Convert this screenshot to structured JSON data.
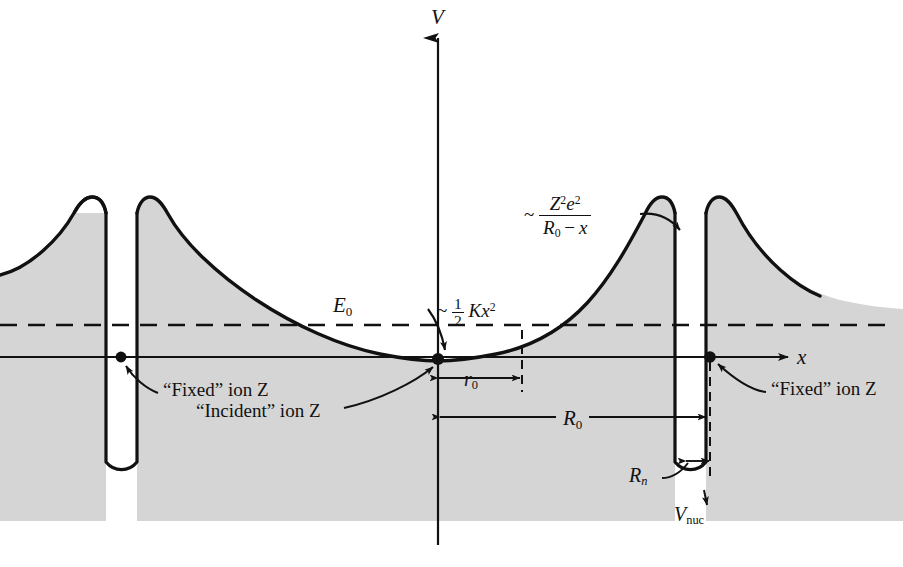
{
  "figure": {
    "type": "potential-energy-diagram",
    "axes": {
      "v_axis_label": "V",
      "x_axis_label": "x"
    },
    "levels": {
      "energy_label": "E",
      "energy_sub": "0"
    },
    "dimensions": [
      {
        "name": "r0",
        "base": "r",
        "sub": "0"
      },
      {
        "name": "R0",
        "base": "R",
        "sub": "0"
      },
      {
        "name": "Rn",
        "base": "R",
        "sub": "n"
      }
    ],
    "annotations": {
      "fixed_ion_left": "“Fixed” ion Z",
      "fixed_ion_right": "“Fixed” ion Z",
      "incident_ion": "“Incident” ion Z",
      "nuclear_potential": {
        "base": "V",
        "sub": "nuc"
      }
    },
    "formulas": {
      "coulomb": {
        "tilde": "~",
        "numerator_z": "Z",
        "numerator_z_exp": "2",
        "numerator_e": "e",
        "numerator_e_exp": "2",
        "denominator_r": "R",
        "denominator_r_sub": "0",
        "denominator_minus": "−",
        "denominator_x": "x"
      },
      "harmonic": {
        "tilde": "~",
        "half_num": "1",
        "half_den": "2",
        "k": "K",
        "x": "x",
        "x_exp": "2"
      }
    },
    "colors": {
      "fill": "#d5d5d5",
      "stroke": "#111111",
      "background": "#ffffff"
    }
  }
}
